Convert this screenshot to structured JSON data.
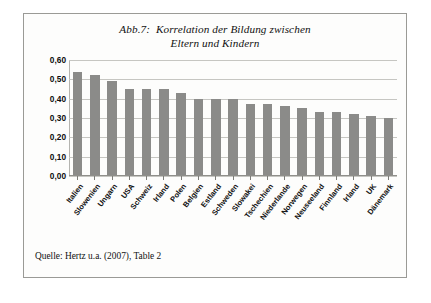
{
  "figure": {
    "title_line1": "Abb.7:  Korrelation der Bildung zwischen",
    "title_line2": "Eltern und Kindern",
    "source": "Quelle: Hertz u.a. (2007), Table 2"
  },
  "chart_data": {
    "type": "bar",
    "title": "Abb.7: Korrelation der Bildung zwischen Eltern und Kindern",
    "xlabel": "",
    "ylabel": "",
    "ylim": [
      0.0,
      0.6
    ],
    "ytick_labels": [
      "0,60",
      "0,50",
      "0,40",
      "0,30",
      "0,20",
      "0,10",
      "0,00"
    ],
    "ytick_values": [
      0.6,
      0.5,
      0.4,
      0.3,
      0.2,
      0.1,
      0.0
    ],
    "grid": true,
    "legend": "none",
    "bar_color": "#8b8b89",
    "categories": [
      "Italien",
      "Slowenien",
      "Ungarn",
      "USA",
      "Schweiz",
      "Irland",
      "Polen",
      "Belgien",
      "Estland",
      "Schweden",
      "Slowakei",
      "Tschechien",
      "Niederlande",
      "Norwegen",
      "Neuseeland",
      "Finnland",
      "Irland",
      "UK",
      "Dänemark"
    ],
    "values": [
      0.54,
      0.52,
      0.49,
      0.45,
      0.45,
      0.45,
      0.43,
      0.4,
      0.4,
      0.4,
      0.37,
      0.37,
      0.36,
      0.35,
      0.33,
      0.33,
      0.32,
      0.31,
      0.3
    ]
  }
}
